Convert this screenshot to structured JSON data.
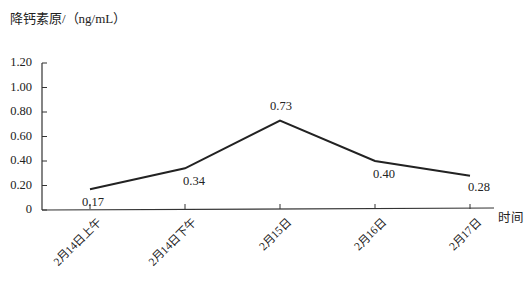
{
  "chart_data": {
    "type": "line",
    "title": "",
    "ylabel": "降钙素原/（ng/mL）",
    "xlabel": "时间",
    "categories": [
      "2月14日上午",
      "2月14日下午",
      "2月15日",
      "2月16日",
      "2月17日"
    ],
    "series": [
      {
        "name": "降钙素原",
        "values": [
          0.17,
          0.34,
          0.73,
          0.4,
          0.28
        ],
        "color": "#222222"
      }
    ],
    "data_labels": [
      "0.17",
      "0.34",
      "0.73",
      "0.40",
      "0.28"
    ],
    "yticks": [
      "0",
      "0.20",
      "0.40",
      "0.60",
      "0.80",
      "1.00",
      "1.20"
    ],
    "ylim": [
      0,
      1.2
    ],
    "grid": false,
    "legend": "none"
  }
}
